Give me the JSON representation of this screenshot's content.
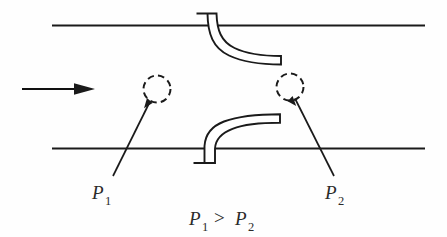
{
  "figure": {
    "type": "technical-diagram",
    "background_color": "#fefefe",
    "ink_color": "#1a1a1a",
    "width": 447,
    "height": 237
  },
  "flow": {
    "arrow_name": "flow-direction-arrow",
    "direction": "left-to-right"
  },
  "duct": {
    "top_wall_label": "top-duct-wall",
    "bottom_wall_label": "bottom-duct-wall"
  },
  "probes": [
    {
      "id": "upper-probe",
      "description": "tube entering through top wall, curving downstream",
      "mounted_on": "top-wall"
    },
    {
      "id": "lower-probe",
      "description": "tube entering through bottom wall, curving downstream",
      "mounted_on": "bottom-wall"
    }
  ],
  "measurement_points": [
    {
      "id": "point-p1",
      "label": "P",
      "subscript": "1",
      "circle_name": "dashed-measurement-circle-p1"
    },
    {
      "id": "point-p2",
      "label": "P",
      "subscript": "2",
      "circle_name": "dashed-measurement-circle-p2"
    }
  ],
  "relation": {
    "left_symbol": "P",
    "left_subscript": "1",
    "operator": ">",
    "right_symbol": "P",
    "right_subscript": "2",
    "full_text": "P1 > P2"
  }
}
